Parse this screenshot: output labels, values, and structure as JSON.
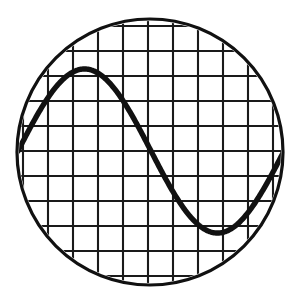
{
  "instrument": {
    "display_type": "oscilloscope-crt-round-screen",
    "background_color": "#ffffff",
    "trace_color": "#111111",
    "graticule_color": "#1a1a1a",
    "bezel_color": "#111111"
  },
  "screen": {
    "shape": "circle",
    "center_x": 150,
    "center_y": 152,
    "radius": 133,
    "bezel_stroke_width": 3.2
  },
  "graticule": {
    "spacing_px": 25,
    "stroke_width": 2.1,
    "vertical_line_x": [
      23,
      48,
      73,
      98,
      123,
      148,
      173,
      198,
      223,
      248,
      273
    ],
    "horizontal_line_y": [
      26,
      51,
      76,
      101,
      126,
      151,
      176,
      201,
      226,
      251,
      276
    ],
    "divisions_x": 10,
    "divisions_y": 10
  },
  "trace": {
    "waveform": "sine",
    "stroke_width": 5.4,
    "center_level_y": 151,
    "amplitude_px": 82,
    "period_px": 266,
    "phase_offset_px": 18,
    "start_x": 18,
    "end_x": 284,
    "peak": {
      "x": 85,
      "y": 70
    },
    "zero_crossing_falling": {
      "x": 150,
      "y": 152
    },
    "trough": {
      "x": 218,
      "y": 228
    },
    "cycles_visible": 1
  },
  "chart_data": {
    "type": "line",
    "title": "",
    "xlabel": "",
    "ylabel": "",
    "grid": true,
    "legend": null,
    "xlim": [
      0,
      1
    ],
    "ylim": [
      -1,
      1
    ],
    "series": [
      {
        "name": "sine-trace",
        "color": "#111111",
        "x": [
          0.0,
          0.05,
          0.1,
          0.15,
          0.2,
          0.25,
          0.3,
          0.35,
          0.4,
          0.45,
          0.5,
          0.55,
          0.6,
          0.65,
          0.7,
          0.75,
          0.8,
          0.85,
          0.9,
          0.95,
          1.0
        ],
        "values": [
          0.0,
          0.31,
          0.59,
          0.81,
          0.95,
          1.0,
          0.95,
          0.81,
          0.59,
          0.31,
          0.0,
          -0.31,
          -0.59,
          -0.81,
          -0.95,
          -1.0,
          -0.95,
          -0.81,
          -0.59,
          -0.31,
          0.0
        ]
      }
    ]
  }
}
